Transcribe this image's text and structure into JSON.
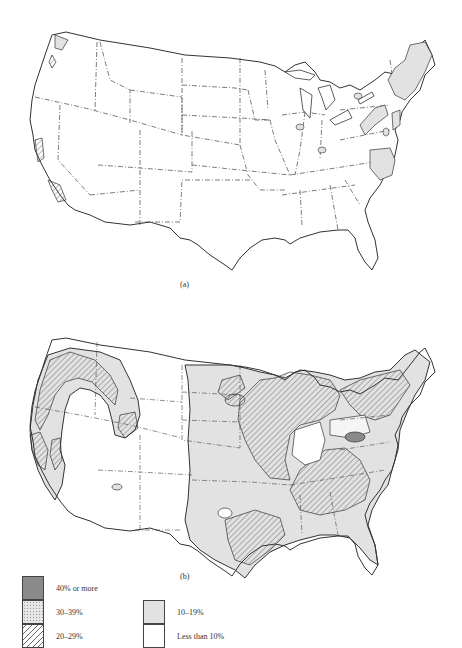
{
  "figure": {
    "panel_a": {
      "caption": "(a)"
    },
    "panel_b": {
      "caption": "(b)"
    }
  },
  "legend": {
    "items": [
      {
        "label": "40% or more",
        "pattern": "dark-gray",
        "color": "#8a8a8a"
      },
      {
        "label": "30–39%",
        "pattern": "stippled",
        "color": "#e6e6e6"
      },
      {
        "label": "20–29%",
        "pattern": "diagonal-hatch",
        "color": "#666666"
      },
      {
        "label": "10–19%",
        "pattern": "light-gray",
        "color": "#e2e2e2"
      },
      {
        "label": "Less than 10%",
        "pattern": "white",
        "color": "#ffffff"
      }
    ]
  },
  "colors": {
    "outline": "#333333",
    "shade_light": "#e2e2e2",
    "shade_dark": "#8a8a8a",
    "hatch": "#666666"
  }
}
